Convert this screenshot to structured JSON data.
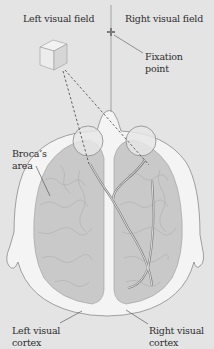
{
  "diagram": {
    "labels": {
      "left_visual_field": "Left visual field",
      "right_visual_field": "Right visual field",
      "fixation_point_line1": "Fixation",
      "fixation_point_line2": "point",
      "brocas_area_line1": "Broca’s",
      "brocas_area_line2": "area",
      "left_visual_cortex_line1": "Left visual",
      "left_visual_cortex_line2": "cortex",
      "right_visual_cortex_line1": "Right visual",
      "right_visual_cortex_line2": "cortex"
    },
    "elements": [
      "cube-object",
      "fixation-cross",
      "vertical-midline",
      "dashed-sight-lines",
      "left-eye",
      "right-eye",
      "optic-pathway",
      "head-outline",
      "left-hemisphere",
      "right-hemisphere"
    ],
    "colors": {
      "background": "#e4e4e4",
      "head": "#f4f4f4",
      "brain": "#c8c8c8",
      "eye": "#e8e8e8",
      "text": "#2e2e2e",
      "fixation_cross": "#888888"
    }
  }
}
